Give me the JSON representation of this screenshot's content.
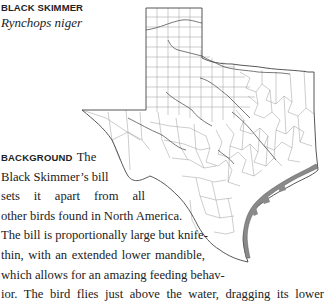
{
  "species": {
    "common_name": "BLACK SKIMMER",
    "scientific_name": "Rynchops niger"
  },
  "map": {
    "icon": "texas-county-range-map",
    "range_color": "#8a8a8a",
    "outline_color": "#555555",
    "county_line_color": "#9a9a9a"
  },
  "background_section": {
    "heading": "BACKGROUND",
    "lines": [
      "The",
      "Black Skimmer’s bill",
      "sets it apart from all",
      "other birds found in North America.",
      "The bill is proportionally large but knife-",
      "thin, with an extended lower mandible,",
      "which allows for an amazing feeding behav-",
      "ior. The bird flies just above the water, dragging its lower"
    ]
  }
}
